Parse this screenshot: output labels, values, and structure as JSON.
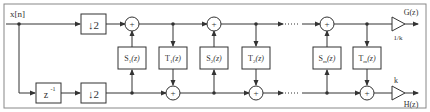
{
  "diagram": {
    "input_label": "x[n]",
    "downsample_top": "↓2",
    "downsample_bottom": "↓2",
    "delay": {
      "base": "z",
      "exp": "-1"
    },
    "blocks": [
      {
        "id": "S1",
        "base": "S",
        "sub": "1",
        "arg": "(z)"
      },
      {
        "id": "T1",
        "base": "T",
        "sub": "1",
        "arg": "(z)"
      },
      {
        "id": "S2",
        "base": "S",
        "sub": "2",
        "arg": "(z)"
      },
      {
        "id": "T2",
        "base": "T",
        "sub": "2",
        "arg": "(z)"
      },
      {
        "id": "Sm",
        "base": "S",
        "sub": "m",
        "arg": "(z)"
      },
      {
        "id": "Tm",
        "base": "T",
        "sub": "m",
        "arg": "(z)"
      }
    ],
    "adder_symbol": "+",
    "gain_top": "1/k",
    "gain_bottom": "k",
    "output_top": "G(z)",
    "output_bottom": "H(z)"
  },
  "colors": {
    "line": "#333333",
    "border": "#888888",
    "background": "#ffffff"
  }
}
